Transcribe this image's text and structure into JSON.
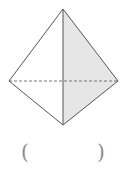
{
  "figure": {
    "type": "pyramid-line-drawing",
    "vertices": {
      "apex": [
        63,
        9
      ],
      "left": [
        9,
        81
      ],
      "right": [
        118,
        81
      ],
      "bottom": [
        63,
        125
      ]
    },
    "colors": {
      "edge": "#555555",
      "shaded_face": "#e6e6e6",
      "hidden_edge": "#666666"
    }
  },
  "answer": {
    "open_paren": "(",
    "close_paren": ")",
    "value": ""
  }
}
